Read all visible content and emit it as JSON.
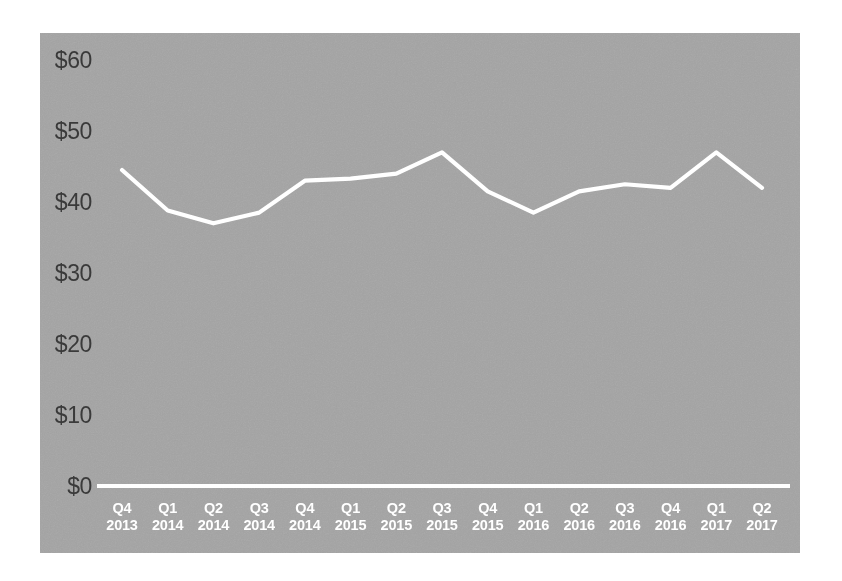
{
  "chart_data": {
    "type": "line",
    "title": "",
    "subtitle": "",
    "xlabel": "",
    "ylabel": "",
    "categories": [
      "Q4 2013",
      "Q1 2014",
      "Q2 2014",
      "Q3 2014",
      "Q4 2014",
      "Q1 2015",
      "Q2 2015",
      "Q3 2015",
      "Q4 2015",
      "Q1 2016",
      "Q2 2016",
      "Q3 2016",
      "Q4 2016",
      "Q1 2017",
      "Q2 2017"
    ],
    "quarter_labels": [
      "Q4",
      "Q1",
      "Q2",
      "Q3",
      "Q4",
      "Q1",
      "Q2",
      "Q3",
      "Q4",
      "Q1",
      "Q2",
      "Q3",
      "Q4",
      "Q1",
      "Q2"
    ],
    "year_labels": [
      "2013",
      "2014",
      "2014",
      "2014",
      "2014",
      "2015",
      "2015",
      "2015",
      "2015",
      "2016",
      "2016",
      "2016",
      "2016",
      "2017",
      "2017"
    ],
    "values": [
      44.5,
      38.8,
      37.0,
      38.5,
      43.0,
      43.3,
      44.0,
      47.0,
      41.5,
      38.5,
      41.5,
      42.5,
      42.0,
      47.0,
      42.0
    ],
    "ylim": [
      0,
      60
    ],
    "ytick_values": [
      0,
      10,
      20,
      30,
      40,
      50,
      60
    ],
    "ytick_labels": [
      "$0",
      "$10",
      "$20",
      "$30",
      "$40",
      "$50",
      "$60"
    ],
    "grid": false,
    "legend": "none",
    "drop_lines": true,
    "series": [
      {
        "name": "value",
        "values": [
          44.5,
          38.8,
          37.0,
          38.5,
          43.0,
          43.3,
          44.0,
          47.0,
          41.5,
          38.5,
          41.5,
          42.5,
          42.0,
          47.0,
          42.0
        ]
      }
    ]
  },
  "style": {
    "panel_background": "#a2a2a2",
    "line_color": "#ffffff",
    "axis_color": "#ffffff",
    "ytick_color": "#3a3a3a",
    "xtick_color": "#ffffff",
    "page_background": "#ffffff"
  }
}
